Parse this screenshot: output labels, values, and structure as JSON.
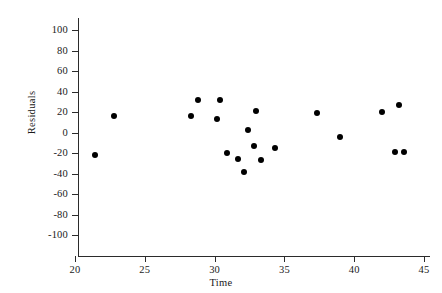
{
  "chart_data": {
    "type": "scatter",
    "title": "",
    "xlabel": "Time",
    "ylabel": "Residuals",
    "xlim": [
      20,
      45
    ],
    "ylim": [
      -100,
      100
    ],
    "xticks": [
      20,
      25,
      30,
      35,
      40,
      45
    ],
    "yticks": [
      100,
      80,
      60,
      40,
      20,
      0,
      -20,
      -40,
      -60,
      -80,
      -100
    ],
    "xtick_labels": [
      "20",
      "25",
      "30",
      "35",
      "40",
      "45"
    ],
    "ytick_labels": [
      "100",
      "80",
      "60",
      "40",
      "20",
      "0",
      "-20",
      "-40",
      "-60",
      "-80",
      "-100"
    ],
    "grid": false,
    "legend": null,
    "marker": "filled-circle",
    "marker_color": "#000000",
    "series": [
      {
        "name": "residuals",
        "x": [
          21.4,
          22.8,
          28.3,
          28.8,
          30.2,
          30.4,
          30.9,
          31.7,
          32.1,
          32.4,
          32.8,
          33.0,
          33.3,
          34.3,
          37.3,
          39.0,
          42.0,
          43.2,
          42.9,
          43.6
        ],
        "y": [
          -22,
          16,
          16,
          32,
          13,
          32,
          -20,
          -26,
          -39,
          2,
          -13,
          21,
          -27,
          -15,
          19,
          -4,
          20,
          27,
          -19,
          -19
        ]
      }
    ]
  },
  "axis": {
    "line_color": "#2b2b2b",
    "tick_color": "#2b2b2b"
  }
}
